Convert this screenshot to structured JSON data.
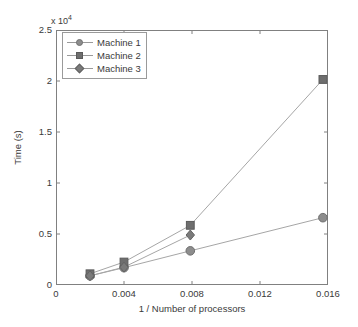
{
  "chart_data": {
    "type": "line",
    "title": "",
    "xlabel": "1 / Number of processors",
    "ylabel": "Time (s)",
    "y_exponent_label": "x 10",
    "y_exponent_power": "4",
    "xlim": [
      0,
      0.016
    ],
    "ylim": [
      0,
      25000
    ],
    "grid": false,
    "legend_position": "top-left",
    "xticks": [
      "0",
      "0.004",
      "0.008",
      "0.012",
      "0.016"
    ],
    "xtick_values": [
      0,
      0.004,
      0.008,
      0.012,
      0.016
    ],
    "yticks": [
      "0",
      "0.5",
      "1",
      "1.5",
      "2",
      "2.5"
    ],
    "ytick_values": [
      0,
      5000,
      10000,
      15000,
      20000,
      25000
    ],
    "series": [
      {
        "name": "Machine 1",
        "marker": "circle",
        "color": "#8d8d8d",
        "x": [
          0.002,
          0.004,
          0.0079,
          0.0157
        ],
        "values": [
          900,
          1700,
          3350,
          6600
        ]
      },
      {
        "name": "Machine 2",
        "marker": "square",
        "color": "#6e6e6e",
        "x": [
          0.002,
          0.004,
          0.0079,
          0.0157
        ],
        "values": [
          1100,
          2250,
          5850,
          20150
        ]
      },
      {
        "name": "Machine 3",
        "marker": "diamond",
        "color": "#7a7a7a",
        "x": [
          0.002,
          0.004,
          0.0079
        ],
        "values": [
          900,
          1750,
          4900
        ]
      }
    ]
  }
}
